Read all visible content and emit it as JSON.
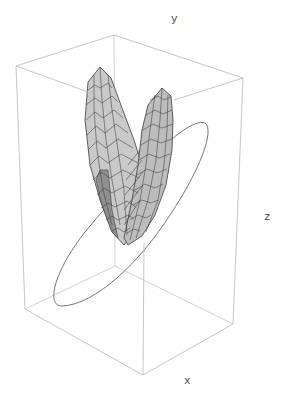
{
  "figure": {
    "type": "3d-surface-plot",
    "axes": {
      "x_label": "x",
      "y_label": "y",
      "z_label": "z"
    },
    "colors": {
      "box_edge": "#b8b8b8",
      "surface_light": "#d4d4d4",
      "surface_mid": "#b0b0b0",
      "surface_dark": "#8a8a8a",
      "mesh": "#3a3a3a",
      "ellipse": "#666666",
      "label": "#444444"
    }
  },
  "caption": ""
}
